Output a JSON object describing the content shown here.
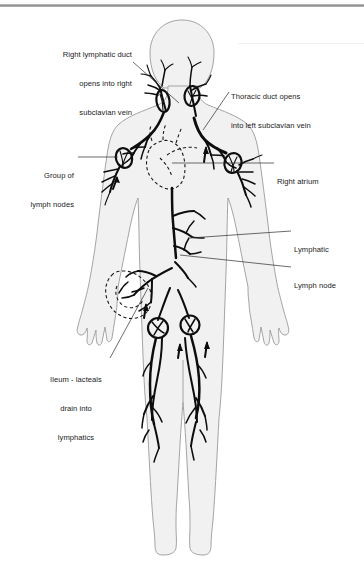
{
  "figure": {
    "top_rule_color": "#8f8f8f",
    "body_fill_color": "#f1f1f1",
    "body_outline_color": "#9a9a9a",
    "vessel_color": "#0d0d0d",
    "dashed_organ_color": "#1a1a1a",
    "leader_line_color": "#2b2b2b",
    "background_color": "#ffffff"
  },
  "labels": [
    {
      "id": "right-lymphatic-duct",
      "name": "right-lymphatic-duct-label",
      "lines": [
        "Right lymphatic duct",
        "opens into right",
        "subclavian vein"
      ],
      "text": "Right lymphatic duct opens into right subclavian vein",
      "align": "right",
      "x": 28,
      "y": 31,
      "width": 104,
      "leader": {
        "x1": 133,
        "y1": 62,
        "x2": 179,
        "y2": 103
      }
    },
    {
      "id": "thoracic-duct",
      "name": "thoracic-duct-label",
      "lines": [
        "Thoracic duct opens",
        "into left subclavian vein"
      ],
      "text": "Thoracic duct opens into left subclavian vein",
      "align": "left",
      "x": 231,
      "y": 73,
      "width": 122,
      "leader": {
        "x1": 229,
        "y1": 92,
        "x2": 203,
        "y2": 130
      }
    },
    {
      "id": "group-of-lymph-nodes",
      "name": "group-of-lymph-nodes-label",
      "lines": [
        "Group of",
        "lymph nodes"
      ],
      "text": "Group of lymph nodes",
      "align": "right",
      "x": 16,
      "y": 152,
      "width": 58,
      "leader": {
        "x1": 78,
        "y1": 157,
        "x2": 118,
        "y2": 157
      }
    },
    {
      "id": "right-atrium",
      "name": "right-atrium-label",
      "lines": [
        "Right atrium"
      ],
      "text": "Right atrium",
      "align": "left",
      "x": 277,
      "y": 160,
      "width": 56,
      "leader": {
        "x1": 274,
        "y1": 163,
        "x2": 172,
        "y2": 163
      }
    },
    {
      "id": "lymphatic",
      "name": "lymphatic-label",
      "lines": [
        "Lymphatic"
      ],
      "text": "Lymphatic",
      "align": "left",
      "x": 294,
      "y": 228,
      "width": 48,
      "leader": {
        "x1": 291,
        "y1": 231,
        "x2": 190,
        "y2": 238
      }
    },
    {
      "id": "lymph-node",
      "name": "lymph-node-label",
      "lines": [
        "Lymph node"
      ],
      "text": "Lymph node",
      "align": "left",
      "x": 294,
      "y": 264,
      "width": 54,
      "leader": {
        "x1": 291,
        "y1": 267,
        "x2": 180,
        "y2": 255
      }
    },
    {
      "id": "ileum-lacteals",
      "name": "ileum-lacteals-label",
      "lines": [
        "Ileum - lacteals",
        "drain into",
        "lymphatics"
      ],
      "text": "Ileum - lacteals drain into lymphatics",
      "align": "center",
      "x": 41,
      "y": 356,
      "width": 70,
      "leader": {
        "x1": 110,
        "y1": 358,
        "x2": 148,
        "y2": 288
      }
    }
  ],
  "anatomy_parts": [
    {
      "name": "head",
      "kind": "silhouette"
    },
    {
      "name": "neck",
      "kind": "silhouette"
    },
    {
      "name": "torso",
      "kind": "silhouette"
    },
    {
      "name": "left-arm",
      "kind": "silhouette"
    },
    {
      "name": "right-arm",
      "kind": "silhouette"
    },
    {
      "name": "left-leg",
      "kind": "silhouette"
    },
    {
      "name": "right-leg",
      "kind": "silhouette"
    },
    {
      "name": "heart",
      "kind": "dashed-outline"
    },
    {
      "name": "intestine-ileum",
      "kind": "dashed-outline"
    },
    {
      "name": "cervical-lymphatics",
      "kind": "vessel"
    },
    {
      "name": "axillary-lymph-node-cluster",
      "kind": "node-oval"
    },
    {
      "name": "thoracic-duct-vessel",
      "kind": "vessel"
    },
    {
      "name": "right-lymphatic-duct-vessel",
      "kind": "vessel"
    },
    {
      "name": "abdominal-lymphatics",
      "kind": "vessel"
    },
    {
      "name": "inguinal-lymph-nodes",
      "kind": "node-circle"
    },
    {
      "name": "leg-lymphatics",
      "kind": "vessel"
    },
    {
      "name": "flow-direction-arrows",
      "kind": "arrow"
    }
  ]
}
